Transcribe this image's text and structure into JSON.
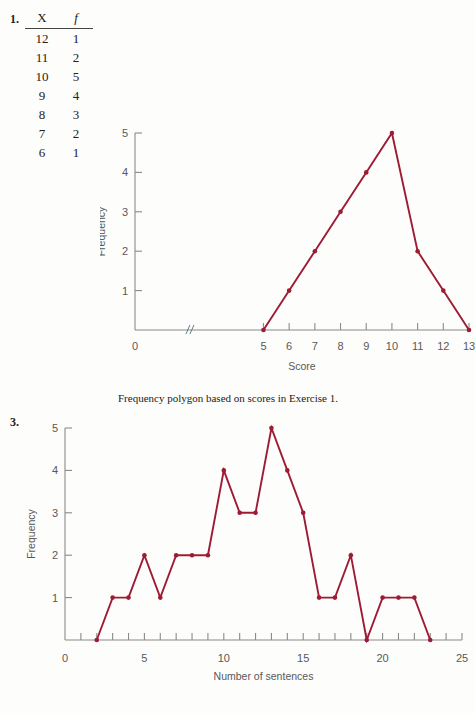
{
  "exercise1": {
    "number": "1.",
    "table": {
      "headers": [
        "X",
        "f"
      ],
      "rows": [
        [
          "12",
          "1"
        ],
        [
          "11",
          "2"
        ],
        [
          "10",
          "5"
        ],
        [
          "9",
          "4"
        ],
        [
          "8",
          "3"
        ],
        [
          "7",
          "2"
        ],
        [
          "6",
          "1"
        ]
      ]
    },
    "caption": "Frequency polygon based on scores in Exercise 1."
  },
  "exercise3": {
    "number": "3."
  },
  "colors": {
    "series": "#9e1b34",
    "axis": "#8a8a8a",
    "label": "#58585a",
    "break": "#5a7f8c",
    "background": "#fdfdfb"
  },
  "chart_data": [
    {
      "type": "line",
      "title": "",
      "xlabel": "Score",
      "ylabel": "Frequency",
      "x": [
        5,
        6,
        7,
        8,
        9,
        10,
        11,
        12,
        13
      ],
      "values": [
        0,
        1,
        2,
        3,
        4,
        5,
        2,
        1,
        0
      ],
      "xlim": [
        0,
        13
      ],
      "ylim": [
        0,
        5
      ],
      "xticks": [
        5,
        6,
        7,
        8,
        9,
        10,
        11,
        12,
        13
      ],
      "xtick_labels": [
        "5",
        "6",
        "7",
        "8",
        "9",
        "10",
        "11",
        "12",
        "13"
      ],
      "x_origin_label": "0",
      "yticks": [
        1,
        2,
        3,
        4,
        5
      ],
      "ytick_labels": [
        "1",
        "2",
        "3",
        "4",
        "5"
      ],
      "axis_break": true,
      "grid": false,
      "legend": "none",
      "markers": true
    },
    {
      "type": "line",
      "title": "",
      "xlabel": "Number of sentences",
      "ylabel": "Frequency",
      "x": [
        2,
        3,
        4,
        5,
        6,
        7,
        8,
        9,
        10,
        11,
        12,
        13,
        14,
        15,
        16,
        17,
        18,
        19,
        20,
        21,
        22,
        23
      ],
      "values": [
        0,
        1,
        1,
        2,
        1,
        2,
        2,
        2,
        4,
        3,
        3,
        5,
        4,
        3,
        1,
        1,
        2,
        0,
        1,
        1,
        1,
        0
      ],
      "xlim": [
        0,
        25
      ],
      "ylim": [
        0,
        5
      ],
      "xticks": [
        1,
        2,
        3,
        4,
        5,
        6,
        7,
        8,
        9,
        10,
        11,
        12,
        13,
        14,
        15,
        16,
        17,
        18,
        19,
        20,
        21,
        22,
        23,
        24,
        25
      ],
      "xtick_labels_shown": [
        "0",
        "5",
        "10",
        "15",
        "20",
        "25"
      ],
      "xtick_label_positions": [
        0,
        5,
        10,
        15,
        20,
        25
      ],
      "yticks": [
        1,
        2,
        3,
        4,
        5
      ],
      "ytick_labels": [
        "1",
        "2",
        "3",
        "4",
        "5"
      ],
      "axis_break": false,
      "grid": false,
      "legend": "none",
      "markers": true
    }
  ]
}
